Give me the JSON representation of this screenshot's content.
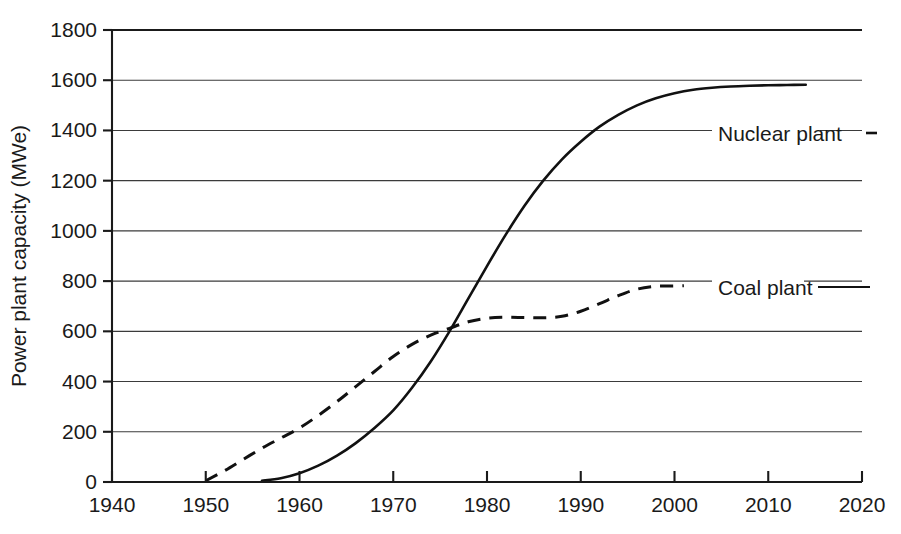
{
  "chart_data": {
    "type": "line",
    "title": "",
    "xlabel": "",
    "ylabel": "Power plant capacity (MWe)",
    "xlim": [
      1940,
      2020
    ],
    "ylim": [
      0,
      1800
    ],
    "xticks": [
      1940,
      1950,
      1960,
      1970,
      1980,
      1990,
      2000,
      2010,
      2020
    ],
    "yticks": [
      0,
      200,
      400,
      600,
      800,
      1000,
      1200,
      1400,
      1600,
      1800
    ],
    "grid": "horizontal",
    "legend_position": "inline-annotation-right",
    "series": [
      {
        "name": "Nuclear plant",
        "style": "solid",
        "color": "#111111",
        "x": [
          1956,
          1958,
          1960,
          1962,
          1964,
          1966,
          1968,
          1970,
          1972,
          1974,
          1976,
          1978,
          1980,
          1982,
          1984,
          1986,
          1988,
          1990,
          1992,
          1994,
          1996,
          1998,
          2000,
          2002,
          2004,
          2006,
          2008,
          2010,
          2012,
          2014
        ],
        "y": [
          5,
          15,
          35,
          65,
          105,
          155,
          215,
          285,
          375,
          480,
          600,
          730,
          860,
          985,
          1100,
          1200,
          1285,
          1355,
          1415,
          1462,
          1500,
          1528,
          1548,
          1562,
          1570,
          1575,
          1578,
          1580,
          1581,
          1582
        ]
      },
      {
        "name": "Coal plant",
        "style": "dashed",
        "color": "#111111",
        "x": [
          1950,
          1952,
          1954,
          1956,
          1958,
          1960,
          1962,
          1964,
          1966,
          1968,
          1970,
          1972,
          1974,
          1976,
          1978,
          1980,
          1982,
          1984,
          1986,
          1988,
          1990,
          1992,
          1994,
          1996,
          1998,
          2000,
          2001
        ],
        "y": [
          5,
          45,
          90,
          135,
          175,
          215,
          265,
          320,
          380,
          440,
          500,
          548,
          585,
          612,
          638,
          652,
          656,
          655,
          654,
          660,
          680,
          710,
          742,
          768,
          779,
          781,
          782
        ]
      }
    ],
    "annotations": [
      {
        "text": "Nuclear plant",
        "series": "Nuclear plant",
        "at_value": 1400
      },
      {
        "text": "Coal plant",
        "series": "Coal plant",
        "at_value": 800
      }
    ]
  },
  "axes": {
    "y_title": "Power plant capacity (MWe)",
    "y_tick_labels": [
      "0",
      "200",
      "400",
      "600",
      "800",
      "1000",
      "1200",
      "1400",
      "1600",
      "1800"
    ],
    "x_tick_labels": [
      "1940",
      "1950",
      "1960",
      "1970",
      "1980",
      "1990",
      "2000",
      "2010",
      "2020"
    ]
  },
  "annotations": {
    "nuclear_label": "Nuclear plant",
    "coal_label": "Coal plant"
  },
  "colors": {
    "line": "#111111",
    "grid": "#3b3b3b",
    "axis": "#1a1a1a",
    "background": "#ffffff"
  }
}
